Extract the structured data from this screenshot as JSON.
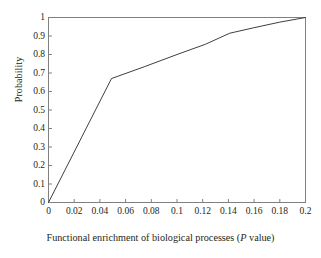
{
  "chart_data": {
    "type": "line",
    "title": "",
    "xlabel_prefix": "Functional enrichment of biological processes (",
    "xlabel_italic": "P",
    "xlabel_suffix": " value)",
    "xlabel": "Functional enrichment of biological processes (P value)",
    "ylabel": "Probability",
    "xlim": [
      0,
      0.2
    ],
    "ylim": [
      0,
      1
    ],
    "grid": false,
    "legend": "none",
    "xticks": [
      "0",
      "0.02",
      "0.04",
      "0.06",
      "0.08",
      "0.1",
      "0.12",
      "0.14",
      "0.16",
      "0.18",
      "0.2"
    ],
    "xtick_values": [
      0,
      0.02,
      0.04,
      0.06,
      0.08,
      0.1,
      0.12,
      0.14,
      0.16,
      0.18,
      0.2
    ],
    "yticks": [
      "0",
      "0.1",
      "0.2",
      "0.3",
      "0.4",
      "0.5",
      "0.6",
      "0.7",
      "0.8",
      "0.9",
      "1"
    ],
    "ytick_values": [
      0,
      0.1,
      0.2,
      0.3,
      0.4,
      0.5,
      0.6,
      0.7,
      0.8,
      0.9,
      1
    ],
    "series": [
      {
        "name": "Cumulative probability",
        "color": "#3f3f3f",
        "x": [
          0,
          0.049,
          0.075,
          0.1,
          0.122,
          0.141,
          0.16,
          0.18,
          0.2
        ],
        "y": [
          0,
          0.67,
          0.735,
          0.8,
          0.855,
          0.915,
          0.945,
          0.975,
          1.0
        ]
      }
    ],
    "line_color": "#3f3f3f",
    "axis_color": "#808080"
  }
}
